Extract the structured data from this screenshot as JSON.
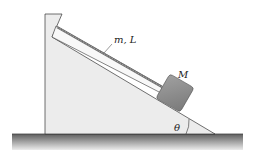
{
  "diagram": {
    "labels": {
      "rope": "m, L",
      "block": "M",
      "angle": "θ"
    },
    "colors": {
      "wedge_fill": "#ececec",
      "incline_board": "#f7f7f7",
      "rope": "#777777",
      "block": "#8c8c8c",
      "ground_top": "#6a6a6a",
      "ground_bottom": "#e6e6e6",
      "line": "#333333"
    }
  }
}
